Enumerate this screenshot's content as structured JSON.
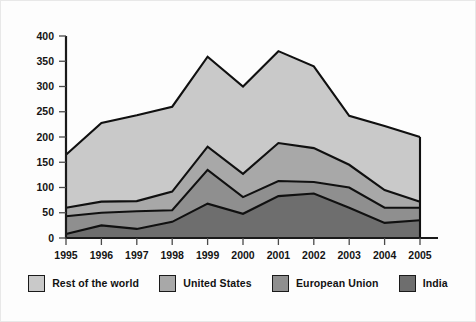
{
  "chart_data": {
    "type": "area",
    "stacked": true,
    "title": "",
    "subtitle": "",
    "xlabel": "",
    "ylabel": "",
    "categories": [
      "1995",
      "1996",
      "1997",
      "1998",
      "1999",
      "2000",
      "2001",
      "2002",
      "2003",
      "2004",
      "2005"
    ],
    "x": [
      1995,
      1996,
      1997,
      1998,
      1999,
      2000,
      2001,
      2002,
      2003,
      2004,
      2005
    ],
    "ylim": [
      0,
      400
    ],
    "xlim": [
      1995,
      2005
    ],
    "yticks": [
      0,
      50,
      100,
      150,
      200,
      250,
      300,
      350,
      400
    ],
    "ytick_labels": [
      "0",
      "50",
      "100",
      "150",
      "200",
      "250",
      "300",
      "350",
      "400"
    ],
    "xtick_labels": [
      "1995",
      "1996",
      "1997",
      "1998",
      "1999",
      "2000",
      "2001",
      "2002",
      "2003",
      "2004",
      "2005"
    ],
    "grid": false,
    "legend_position": "bottom",
    "series": [
      {
        "name": "India",
        "color": "#6e6e6e",
        "stack_order": 1,
        "values": [
          8,
          25,
          18,
          32,
          68,
          48,
          83,
          88,
          60,
          30,
          35
        ],
        "cumulative": [
          8,
          25,
          18,
          32,
          68,
          48,
          83,
          88,
          60,
          30,
          35
        ]
      },
      {
        "name": "European Union",
        "color": "#8f8f8f",
        "stack_order": 2,
        "values": [
          35,
          25,
          35,
          23,
          67,
          33,
          30,
          23,
          40,
          30,
          25
        ],
        "cumulative": [
          43,
          50,
          53,
          55,
          135,
          81,
          113,
          111,
          100,
          60,
          60
        ]
      },
      {
        "name": "United States",
        "color": "#a8a8a8",
        "stack_order": 3,
        "values": [
          17,
          22,
          20,
          37,
          46,
          46,
          75,
          67,
          45,
          35,
          12
        ],
        "cumulative": [
          60,
          72,
          73,
          92,
          181,
          127,
          188,
          178,
          145,
          95,
          72
        ]
      },
      {
        "name": "Rest of the world",
        "color": "#c9c9c9",
        "stack_order": 4,
        "values": [
          105,
          156,
          170,
          168,
          178,
          173,
          182,
          162,
          97,
          127,
          128
        ],
        "cumulative": [
          165,
          228,
          243,
          260,
          359,
          300,
          370,
          340,
          242,
          222,
          200
        ]
      }
    ]
  },
  "legend": {
    "items": [
      {
        "label": "Rest of the world",
        "color": "#c9c9c9"
      },
      {
        "label": "United States",
        "color": "#a8a8a8"
      },
      {
        "label": "European Union",
        "color": "#8f8f8f"
      },
      {
        "label": "India",
        "color": "#6e6e6e"
      }
    ]
  },
  "colors": {
    "background": "#fdfdfd",
    "axis": "#1a1a1a",
    "outline": "#101010",
    "text": "#121212"
  }
}
